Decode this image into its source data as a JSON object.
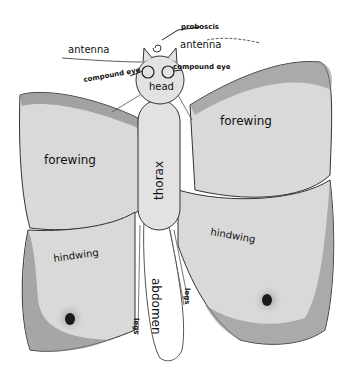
{
  "colors": {
    "wing_fill": "#d9d9d9",
    "wing_edge": "#8a8a8a",
    "body_fill": "#e2e2e2",
    "outline": "#333333",
    "spot": "#1a1a1a",
    "ink": "#111111"
  },
  "labels": {
    "proboscis": "proboscis",
    "antenna_left": "antenna",
    "antenna_right": "antenna",
    "compound_eye_left": "compound eye",
    "compound_eye_right": "compound eye",
    "head": "head",
    "thorax": "thorax",
    "abdomen": "abdomen",
    "forewing_left": "forewing",
    "forewing_right": "forewing",
    "hindwing_left": "hindwing",
    "hindwing_right": "hindwing",
    "legs_left": "legs",
    "legs_right": "legs"
  }
}
